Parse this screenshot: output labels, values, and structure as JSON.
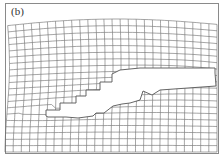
{
  "figure": {
    "panel_label": "(b)",
    "colors": {
      "background": "#ffffff",
      "mesh_line": "#6a6a6a",
      "frame": "#8a8a8a",
      "crack_fill": "#ffffff",
      "crack_edge": "#555555"
    },
    "mesh": {
      "columns": 26,
      "rows": 20
    }
  }
}
